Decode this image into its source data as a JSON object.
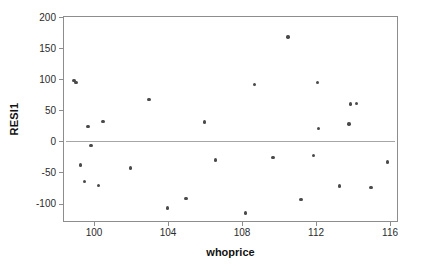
{
  "chart_data": {
    "type": "scatter",
    "title": "",
    "xlabel": "whoprice",
    "ylabel": "RESI1",
    "xlim": [
      98.4,
      116.4
    ],
    "ylim": [
      -128,
      200
    ],
    "grid": false,
    "legend": "none",
    "xticks": [
      100,
      104,
      108,
      112,
      116
    ],
    "yticks": [
      200,
      150,
      100,
      50,
      0,
      -50,
      -100
    ],
    "reference_line": {
      "orientation": "horizontal",
      "y": 0,
      "color": "#a6a6a6"
    },
    "marker": {
      "shape": "circle",
      "color": "#4a4a4a",
      "size": 3.4
    },
    "series": [
      {
        "name": "RESI1 vs whoprice",
        "points": [
          {
            "x": 98.95,
            "y": 98
          },
          {
            "x": 99.05,
            "y": 95
          },
          {
            "x": 99.3,
            "y": -38
          },
          {
            "x": 99.5,
            "y": -64
          },
          {
            "x": 99.7,
            "y": 24
          },
          {
            "x": 99.85,
            "y": -7
          },
          {
            "x": 100.25,
            "y": -71
          },
          {
            "x": 100.5,
            "y": 32
          },
          {
            "x": 102.0,
            "y": -43
          },
          {
            "x": 103.0,
            "y": 67
          },
          {
            "x": 104.0,
            "y": -107
          },
          {
            "x": 105.0,
            "y": -92
          },
          {
            "x": 106.0,
            "y": 31
          },
          {
            "x": 106.6,
            "y": -30
          },
          {
            "x": 108.2,
            "y": -115
          },
          {
            "x": 108.7,
            "y": 91
          },
          {
            "x": 109.7,
            "y": -26
          },
          {
            "x": 110.5,
            "y": 168
          },
          {
            "x": 111.2,
            "y": -93
          },
          {
            "x": 111.9,
            "y": -23
          },
          {
            "x": 112.1,
            "y": 95
          },
          {
            "x": 112.15,
            "y": 21
          },
          {
            "x": 113.3,
            "y": -72
          },
          {
            "x": 113.8,
            "y": 28
          },
          {
            "x": 113.9,
            "y": 60
          },
          {
            "x": 114.2,
            "y": 61
          },
          {
            "x": 115.0,
            "y": -74
          },
          {
            "x": 115.9,
            "y": -33
          }
        ]
      }
    ]
  },
  "axes": {
    "x_title": "whoprice",
    "y_title": "RESI1"
  },
  "colors": {
    "frame": "#8d8d8d",
    "marker": "#4a4a4a",
    "reference_line": "#a6a6a6",
    "text": "#111111",
    "background": "#ffffff"
  }
}
